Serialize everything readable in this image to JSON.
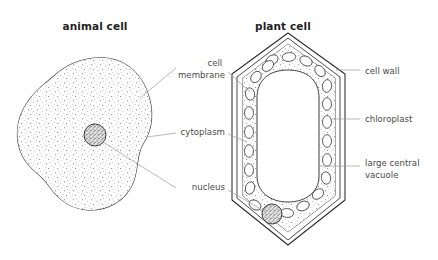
{
  "diagram": {
    "background_color": "#ffffff",
    "line_color": "#2b2b2b",
    "leader_color": "#9b9b9b",
    "label_color": "#4a4a4a",
    "title_color": "#1f1f1f"
  },
  "panels": [
    {
      "id": "animal",
      "title": "animal cell",
      "title_x": 95,
      "title_y": 30
    },
    {
      "id": "plant",
      "title": "plant cell",
      "title_x": 283,
      "title_y": 30
    }
  ],
  "center_labels": [
    {
      "id": "cell-membrane",
      "text_lines": [
        "cell",
        "membrane"
      ],
      "x": 225,
      "y": 66,
      "anchor": "end"
    },
    {
      "id": "cytoplasm",
      "text_lines": [
        "cytoplasm"
      ],
      "x": 225,
      "y": 135,
      "anchor": "end"
    },
    {
      "id": "nucleus",
      "text_lines": [
        "nucleus"
      ],
      "x": 225,
      "y": 190,
      "anchor": "end"
    }
  ],
  "right_labels": [
    {
      "id": "cell-wall",
      "text_lines": [
        "cell wall"
      ],
      "x": 365,
      "y": 74,
      "anchor": "start"
    },
    {
      "id": "chloroplast",
      "text_lines": [
        "chloroplast"
      ],
      "x": 365,
      "y": 122,
      "anchor": "start"
    },
    {
      "id": "large-central-vacuole",
      "text_lines": [
        "large central",
        "vacuole"
      ],
      "x": 365,
      "y": 166,
      "anchor": "start"
    }
  ],
  "structures": {
    "animal_cell": {
      "name": "animal cell body",
      "has_stipple_cytoplasm": true,
      "nucleus": {
        "cx": 95,
        "cy": 135,
        "r": 11
      }
    },
    "plant_cell": {
      "name": "plant cell body",
      "has_double_cell_wall": true,
      "has_stipple_cytoplasm": true,
      "chloroplast_count": 22,
      "vacuole": {
        "label": "large central vacuole"
      },
      "nucleus": {
        "cx": 272,
        "cy": 214,
        "r": 10
      }
    }
  }
}
